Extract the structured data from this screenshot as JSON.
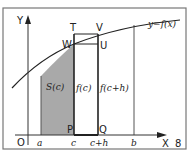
{
  "figure": {
    "number": "8",
    "curve_label": "y=f(x)",
    "axes": {
      "x_label": "X",
      "y_label": "Y",
      "origin_label": "O"
    },
    "x_ticks": [
      "a",
      "c",
      "c+h",
      "b"
    ],
    "points": {
      "T": "T",
      "V": "V",
      "W": "W",
      "U": "U",
      "P": "P",
      "Q": "Q"
    },
    "region_label": "S(c)",
    "heights": {
      "left": "f(c)",
      "right": "f(c+h)"
    },
    "colors": {
      "shade": "#a9a9a9",
      "line": "#222222",
      "frame": "#555555"
    }
  }
}
